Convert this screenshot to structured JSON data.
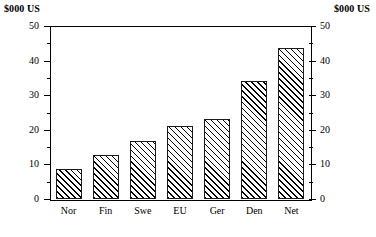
{
  "chart_data": {
    "type": "bar",
    "title": "",
    "subtitle": "",
    "xlabel": "",
    "ylabel": "$000 US",
    "ylabel_right": "$000 US",
    "categories": [
      "Nor",
      "Fin",
      "Swe",
      "EU",
      "Ger",
      "Den",
      "Net"
    ],
    "values": [
      8.7,
      12.7,
      16.7,
      21.0,
      23.0,
      34.0,
      43.7
    ],
    "ylim": [
      0,
      50
    ],
    "y_major_ticks": [
      0,
      10,
      20,
      30,
      40,
      50
    ],
    "y_minor_ticks": [
      5,
      15,
      25,
      35,
      45
    ],
    "y_tick_labels": [
      "0",
      "10",
      "20",
      "30",
      "40",
      "50"
    ],
    "grid": false,
    "legend": null,
    "legend_position": "none",
    "bar_fill": "diagonal-hatch",
    "bar_edge_color": "#000000",
    "background": "#ffffff",
    "axis_left_labels": [
      "0",
      "10",
      "20",
      "30",
      "40",
      "50"
    ],
    "axis_right_labels": [
      "0",
      "10",
      "20",
      "30",
      "40",
      "50"
    ]
  },
  "labels": {
    "unit_left": "$000 US",
    "unit_right": "$000 US"
  }
}
